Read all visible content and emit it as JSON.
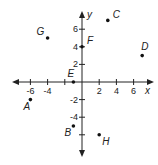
{
  "chart_data": {
    "type": "scatter",
    "title": "",
    "xlabel": "x",
    "ylabel": "y",
    "xlim": [
      -8,
      8
    ],
    "ylim": [
      -8,
      8
    ],
    "x_ticks": [
      -6,
      -4,
      -2,
      2,
      4,
      6
    ],
    "x_tick_labels": [
      "-6",
      "-4",
      "",
      "2",
      "4",
      "6"
    ],
    "y_ticks": [
      -6,
      -4,
      -2,
      2,
      4,
      6
    ],
    "y_tick_labels": [
      "",
      "-4",
      "-2",
      "2",
      "4",
      "6"
    ],
    "grid": false,
    "points": [
      {
        "label": "A",
        "x": -6,
        "y": -2
      },
      {
        "label": "B",
        "x": -1,
        "y": -5
      },
      {
        "label": "C",
        "x": 3,
        "y": 7
      },
      {
        "label": "D",
        "x": 7,
        "y": 3
      },
      {
        "label": "E",
        "x": -1,
        "y": 0
      },
      {
        "label": "F",
        "x": 0,
        "y": 4
      },
      {
        "label": "G",
        "x": -4,
        "y": 5
      },
      {
        "label": "H",
        "x": 2,
        "y": -6
      }
    ]
  },
  "colors": {
    "axis": "#222222",
    "point": "#111111",
    "background": "#ffffff"
  }
}
